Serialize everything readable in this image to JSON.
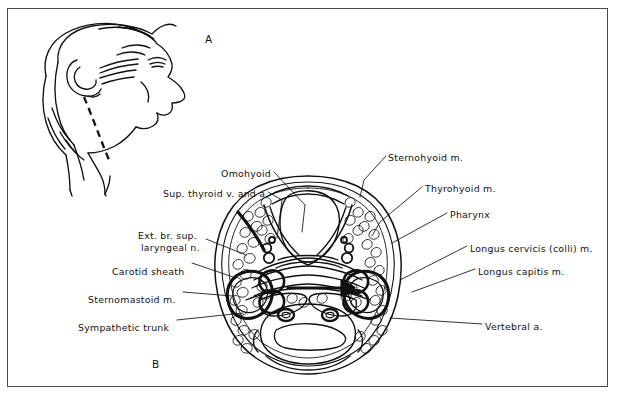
{
  "figure": {
    "panels": [
      {
        "id": "A",
        "letter": "A",
        "x": 205,
        "y": 33,
        "description": "lateral line drawing of head and neck in profile with dashed line marking section level"
      },
      {
        "id": "B",
        "letter": "B",
        "x": 152,
        "y": 358,
        "description": "transverse (axial) section through the neck at the level of the larynx"
      }
    ],
    "labels_left": [
      {
        "text": "Omohyoid",
        "x": 221,
        "y": 168,
        "anchor_x": 307,
        "anchor_y": 248
      },
      {
        "text": "Sup. thyroid v. and a.",
        "x": 163,
        "y": 188,
        "anchor_x": 271,
        "anchor_y": 246
      },
      {
        "text": "Ext. br. sup.",
        "x": 138,
        "y": 230,
        "anchor_x": 245,
        "anchor_y": 258
      },
      {
        "text": "laryngeal n.",
        "x": 141,
        "y": 242,
        "anchor_x": 245,
        "anchor_y": 258
      },
      {
        "text": "Carotid sheath",
        "x": 112,
        "y": 266,
        "anchor_x": 233,
        "anchor_y": 281
      },
      {
        "text": "Sternomastoid m.",
        "x": 88,
        "y": 294,
        "anchor_x": 228,
        "anchor_y": 297
      },
      {
        "text": "Sympathetic trunk",
        "x": 78,
        "y": 322,
        "anchor_x": 238,
        "anchor_y": 318
      }
    ],
    "labels_right": [
      {
        "text": "Sternohyoid m.",
        "x": 388,
        "y": 152,
        "anchor_x": 372,
        "anchor_y": 196
      },
      {
        "text": "Thyrohyoid m.",
        "x": 425,
        "y": 183,
        "anchor_x": 378,
        "anchor_y": 231
      },
      {
        "text": "Pharynx",
        "x": 450,
        "y": 209,
        "anchor_x": 384,
        "anchor_y": 244
      },
      {
        "text": "Longus cervicis (colli) m.",
        "x": 470,
        "y": 243,
        "anchor_x": 398,
        "anchor_y": 283
      },
      {
        "text": "Longus capitis m.",
        "x": 478,
        "y": 266,
        "anchor_x": 416,
        "anchor_y": 293
      },
      {
        "text": "Vertebral a.",
        "x": 485,
        "y": 321,
        "anchor_x": 388,
        "anchor_y": 318
      }
    ],
    "colors": {
      "ink": "#111111",
      "frame": "#4a4a4a",
      "background": "#ffffff"
    }
  }
}
